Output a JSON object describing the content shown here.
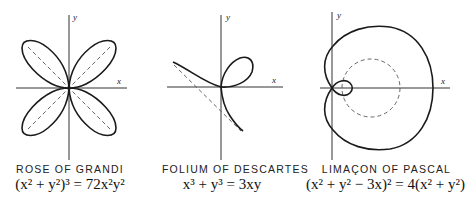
{
  "figures": [
    {
      "id": "rose-of-grandi",
      "caption": "ROSE OF GRANDI",
      "equation": "(x² + y²)³ = 72x²y²",
      "axis_labels": {
        "x": "x",
        "y": "y"
      }
    },
    {
      "id": "folium-of-descartes",
      "caption": "FOLIUM OF DESCARTES",
      "equation": "x³ + y³ = 3xy",
      "axis_labels": {
        "x": "x",
        "y": "y"
      }
    },
    {
      "id": "limacon-of-pascal",
      "caption": "LIMAÇON OF PASCAL",
      "equation": "(x² + y² − 3x)² = 4(x² + y²)",
      "axis_labels": {
        "x": "x",
        "y": "y"
      }
    }
  ],
  "colors": {
    "curve": "#1a1a1a",
    "axis": "#333333",
    "dashed": "#555555",
    "background": "#ffffff"
  }
}
